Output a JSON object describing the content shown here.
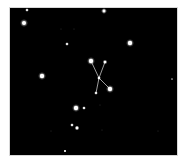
{
  "scene": {
    "background_color": "#000000",
    "frame_color": "#ffffff",
    "sky_rect": {
      "x": 10,
      "y": 8,
      "w": 167,
      "h": 147
    }
  },
  "constellation": {
    "line_color": "#e8e8e8",
    "stars": [
      {
        "id": "c1",
        "x": 91,
        "y": 61,
        "r": 2.2,
        "glow": 4
      },
      {
        "id": "c2",
        "x": 105,
        "y": 62,
        "r": 1.3,
        "glow": 2.5
      },
      {
        "id": "c3",
        "x": 99,
        "y": 78,
        "r": 1.2,
        "glow": 2
      },
      {
        "id": "c4",
        "x": 110,
        "y": 89,
        "r": 2.2,
        "glow": 4
      },
      {
        "id": "c5",
        "x": 96,
        "y": 93,
        "r": 1.0,
        "glow": 2
      }
    ],
    "lines": [
      {
        "from": "c1",
        "to": "c3"
      },
      {
        "from": "c3",
        "to": "c4"
      },
      {
        "from": "c2",
        "to": "c3"
      },
      {
        "from": "c3",
        "to": "c5"
      }
    ]
  },
  "field_stars": [
    {
      "x": 27,
      "y": 10,
      "r": 1.0,
      "glow": 2
    },
    {
      "x": 24,
      "y": 23,
      "r": 2.0,
      "glow": 4
    },
    {
      "x": 104,
      "y": 11,
      "r": 1.4,
      "glow": 3
    },
    {
      "x": 67,
      "y": 44,
      "r": 1.0,
      "glow": 2
    },
    {
      "x": 130,
      "y": 43,
      "r": 2.2,
      "glow": 4
    },
    {
      "x": 42,
      "y": 76,
      "r": 2.2,
      "glow": 4
    },
    {
      "x": 76,
      "y": 108,
      "r": 2.2,
      "glow": 4
    },
    {
      "x": 84,
      "y": 108,
      "r": 1.1,
      "glow": 2
    },
    {
      "x": 72,
      "y": 125,
      "r": 1.0,
      "glow": 2
    },
    {
      "x": 77,
      "y": 128,
      "r": 1.4,
      "glow": 2.5
    },
    {
      "x": 65,
      "y": 151,
      "r": 0.9,
      "glow": 1.5
    },
    {
      "x": 172,
      "y": 79,
      "r": 0.6,
      "glow": 1
    },
    {
      "x": 61,
      "y": 29,
      "r": 0.5,
      "glow": 0
    },
    {
      "x": 74,
      "y": 29,
      "r": 0.5,
      "glow": 0
    },
    {
      "x": 100,
      "y": 105,
      "r": 0.5,
      "glow": 0
    },
    {
      "x": 102,
      "y": 130,
      "r": 0.5,
      "glow": 0
    },
    {
      "x": 51,
      "y": 131,
      "r": 0.5,
      "glow": 0
    },
    {
      "x": 158,
      "y": 131,
      "r": 0.5,
      "glow": 0
    }
  ]
}
